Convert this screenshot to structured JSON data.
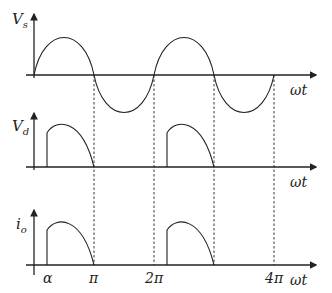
{
  "diagram": {
    "panels": [
      {
        "id": "vs",
        "label_main": "V",
        "label_sub": "s",
        "xlabel": "ωt"
      },
      {
        "id": "vd",
        "label_main": "V",
        "label_sub": "d",
        "xlabel": "ωt"
      },
      {
        "id": "io",
        "label_main": "i",
        "label_sub": "o",
        "xlabel": "ωt"
      }
    ],
    "x_ticks": [
      {
        "label": "α",
        "x": 47
      },
      {
        "label": "π",
        "x": 94
      },
      {
        "label": "2π",
        "x": 154
      },
      {
        "label": "4π",
        "x": 274
      }
    ],
    "firing_angle_label": "α",
    "colors": {
      "line": "#222222",
      "background": "#ffffff"
    }
  }
}
